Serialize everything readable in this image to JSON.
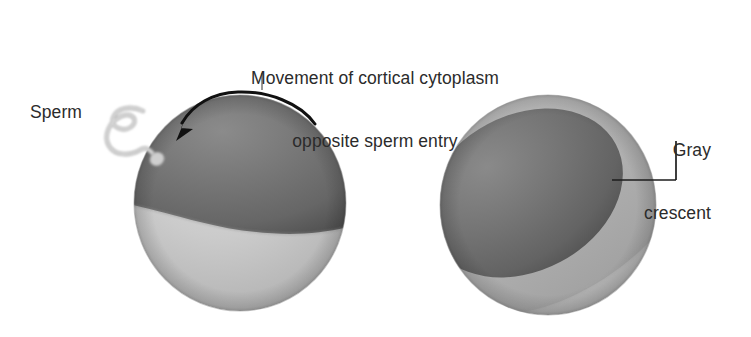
{
  "figure": {
    "background_color": "#ffffff",
    "text_color": "#2b2b2b",
    "width": 751,
    "height": 337
  },
  "labels": {
    "movement_caption_line1": "Movement of cortical cytoplasm",
    "movement_caption_line2": "opposite sperm entry",
    "sperm": "Sperm",
    "gray_crescent_line1": "Gray",
    "gray_crescent_line2": "crescent"
  },
  "colors": {
    "animal_pole_dark": "#6e6e6e",
    "animal_pole_dark_shadow": "#4f4f4f",
    "vegetal_pole_light": "#c9c9c9",
    "vegetal_pole_light_shadow": "#a8a8a8",
    "gray_crescent": "#b0b0b0",
    "gray_crescent_shadow": "#9a9a9a",
    "sperm_gray": "#b9b9b9",
    "arrow_black": "#111111",
    "leader_gray": "#8d8d8d",
    "outline": "#8a8a8a"
  },
  "diagram": {
    "left_egg": {
      "name": "egg-before-rotation",
      "center_x": 240,
      "center_y": 203,
      "radius_x": 106,
      "radius_y": 108,
      "regions": [
        {
          "name": "animal-pole",
          "shade": "dark",
          "position": "upper"
        },
        {
          "name": "vegetal-pole",
          "shade": "light",
          "position": "lower"
        }
      ],
      "sperm_entry_point_x": 155,
      "sperm_entry_point_y": 158
    },
    "right_egg": {
      "name": "egg-after-rotation",
      "center_x": 548,
      "center_y": 205,
      "radius_x": 108,
      "radius_y": 110,
      "regions": [
        {
          "name": "animal-pole",
          "shade": "dark",
          "position": "upper-left-rotated"
        },
        {
          "name": "gray-crescent",
          "shade": "medium",
          "position": "right-band"
        },
        {
          "name": "vegetal-pole",
          "shade": "light",
          "position": "lower"
        }
      ]
    },
    "arrow": {
      "name": "cortical-rotation-arrow",
      "description": "curved arrow arcing over the animal pole pointing toward sperm entry side",
      "color": "#111111"
    },
    "sperm": {
      "name": "sperm-cell",
      "description": "wavy flagellum with bulbous head contacting the egg surface",
      "color": "#b9b9b9"
    }
  }
}
